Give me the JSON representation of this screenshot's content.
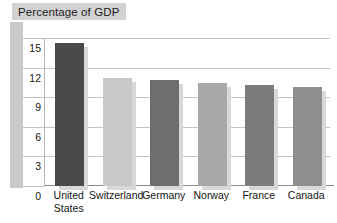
{
  "chart_data": {
    "type": "bar",
    "title": "Percentage of GDP",
    "xlabel": "",
    "ylabel": "",
    "categories": [
      "United States",
      "Switzerland",
      "Germany",
      "Norway",
      "France",
      "Canada"
    ],
    "category_labels_wrapped": [
      "United\nStates",
      "Switzerland",
      "Germany",
      "Norway",
      "France",
      "Canada"
    ],
    "values": [
      14.5,
      10.9,
      10.7,
      10.4,
      10.2,
      10.0
    ],
    "ylim": [
      0,
      15
    ],
    "yticks": [
      0,
      3,
      6,
      9,
      12,
      15
    ],
    "ytick_labels": [
      "0",
      "3",
      "6",
      "9",
      "12",
      "15"
    ],
    "grid": true,
    "legend": false,
    "bar_colors": [
      "#4a4a4a",
      "#c9c9c9",
      "#6e6e6e",
      "#a8a8a8",
      "#7c7c7c",
      "#8f8f8f"
    ],
    "shadow_color": "#d8d8d8",
    "plot_background": "#ffffff",
    "gridline_color": "#c4c4c4",
    "axis_color": "#8d8d8d",
    "title_chip_color": "#d2d2d2",
    "left_band_color": "#c9c9c9"
  }
}
